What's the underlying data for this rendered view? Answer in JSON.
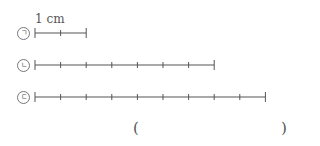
{
  "unit_label": "1 cm",
  "segment_px": 25.6,
  "lines": [
    {
      "marker": "ㄱ",
      "segments": 2,
      "y": 33
    },
    {
      "marker": "ㄴ",
      "segments": 7,
      "y": 65
    },
    {
      "marker": "ㄷ",
      "segments": 9,
      "y": 97
    }
  ],
  "answer": {
    "open": "(",
    "close": ")",
    "value": ""
  }
}
